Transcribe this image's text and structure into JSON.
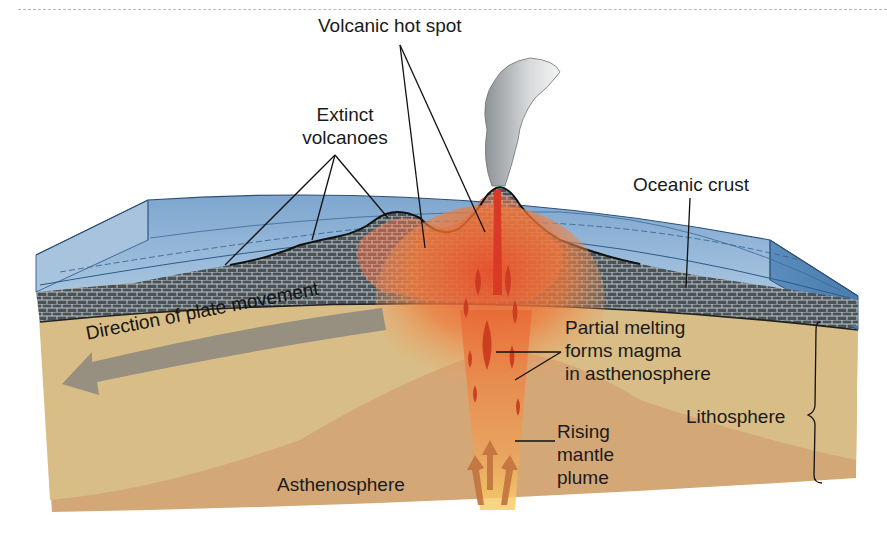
{
  "diagram": {
    "labels": {
      "volcanic_hot_spot": "Volcanic hot spot",
      "extinct_volcanoes_line1": "Extinct",
      "extinct_volcanoes_line2": "volcanoes",
      "oceanic_crust": "Oceanic crust",
      "plate_movement": "Direction of plate movement",
      "partial_melting_line1": "Partial melting",
      "partial_melting_line2": "forms magma",
      "partial_melting_line3": "in asthenosphere",
      "lithosphere": "Lithosphere",
      "rising_plume_line1": "Rising",
      "rising_plume_line2": "mantle",
      "rising_plume_line3": "plume",
      "asthenosphere": "Asthenosphere"
    },
    "colors": {
      "ocean": "#8fb3d6",
      "ocean_dark": "#4f7fae",
      "crust": "#4b5559",
      "lithosphere_mantle": "#d9bb86",
      "asthenosphere": "#d5a877",
      "magma": "#d9452a",
      "plume_glow": "#f0843e",
      "plate_arrow": "#8f8a7e"
    }
  }
}
